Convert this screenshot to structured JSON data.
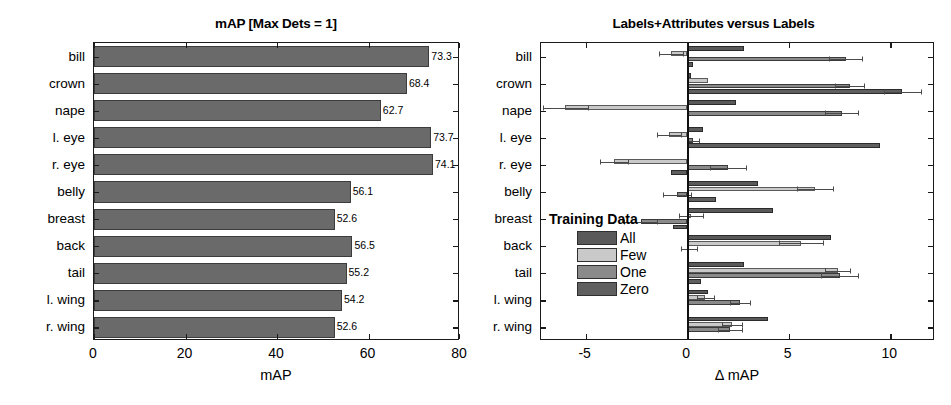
{
  "figure": {
    "width": 951,
    "height": 405,
    "background": "#ffffff"
  },
  "colors": {
    "all": "#595959",
    "few": "#c9c9c9",
    "one": "#8a8a8a",
    "zero": "#5f5f5f",
    "single_bar": "#6a6a6a",
    "axis": "#1a1a1a",
    "error": "#4a4a4a"
  },
  "chart_data": [
    {
      "id": "left",
      "type": "bar",
      "orientation": "horizontal",
      "title": "mAP [Max Dets = 1]",
      "xlabel": "mAP",
      "ylabel": "",
      "xlim": [
        0,
        80
      ],
      "xticks": [
        0,
        20,
        40,
        60,
        80
      ],
      "xticklabels": [
        "0",
        "20",
        "40",
        "60",
        "80"
      ],
      "grid": false,
      "legend": null,
      "categories": [
        "bill",
        "crown",
        "nape",
        "l. eye",
        "r. eye",
        "belly",
        "breast",
        "back",
        "tail",
        "l. wing",
        "r. wing"
      ],
      "values": [
        73.3,
        68.4,
        62.7,
        73.7,
        74.1,
        56.1,
        52.6,
        56.5,
        55.2,
        54.2,
        52.6
      ],
      "value_labels": [
        "73.3",
        "68.4",
        "62.7",
        "73.7",
        "74.1",
        "56.1",
        "52.6",
        "56.5",
        "55.2",
        "54.2",
        "52.6"
      ]
    },
    {
      "id": "right",
      "type": "bar",
      "orientation": "horizontal",
      "title": "Labels+Attributes versus Labels",
      "xlabel": "Δ mAP",
      "ylabel": "",
      "xlim": [
        -7.2,
        12.2
      ],
      "xticks": [
        -5,
        0,
        5,
        10
      ],
      "xticklabels": [
        "-5",
        "0",
        "5",
        "10"
      ],
      "grid": false,
      "zero_reference_line": 0,
      "legend": {
        "title": "Training Data",
        "position": "center-left",
        "entries": [
          "All",
          "Few",
          "One",
          "Zero"
        ]
      },
      "categories": [
        "bill",
        "crown",
        "nape",
        "l. eye",
        "r. eye",
        "belly",
        "breast",
        "back",
        "tail",
        "l. wing",
        "r. wing"
      ],
      "series": [
        {
          "name": "All",
          "color": "#595959",
          "values": [
            2.8,
            0.2,
            2.4,
            0.8,
            0.1,
            3.5,
            4.2,
            7.1,
            2.8,
            1.0,
            4.0
          ],
          "errors": [
            0.0,
            0.0,
            0.0,
            0.0,
            0.0,
            0.0,
            0.0,
            0.0,
            0.0,
            0.0,
            0.0
          ]
        },
        {
          "name": "Few",
          "color": "#c9c9c9",
          "values": [
            -0.8,
            1.0,
            -6.0,
            -0.9,
            -3.6,
            6.3,
            0.2,
            5.6,
            7.4,
            0.9,
            2.2
          ],
          "errors": [
            0.6,
            0.0,
            1.1,
            0.6,
            0.7,
            0.9,
            0.6,
            1.1,
            0.6,
            0.4,
            0.5
          ]
        },
        {
          "name": "One",
          "color": "#8a8a8a",
          "values": [
            7.8,
            8.0,
            7.6,
            0.3,
            2.0,
            -0.5,
            -2.3,
            0.1,
            7.5,
            2.6,
            2.1
          ],
          "errors": [
            0.8,
            0.7,
            0.8,
            0.3,
            0.9,
            0.7,
            0.8,
            0.4,
            0.9,
            0.5,
            0.6
          ]
        },
        {
          "name": "Zero",
          "color": "#5f5f5f",
          "values": [
            0.3,
            10.6,
            0.1,
            9.5,
            -0.8,
            1.4,
            -0.7,
            0.0,
            0.7,
            0.1,
            0.0
          ],
          "errors": [
            0.0,
            0.9,
            0.0,
            0.0,
            0.0,
            0.0,
            0.0,
            0.0,
            0.0,
            0.0,
            0.0
          ]
        }
      ]
    }
  ]
}
